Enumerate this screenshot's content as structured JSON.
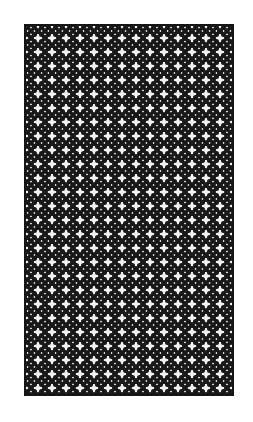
{
  "figure": {
    "title": "Woven Basket-Weave Lattice Pattern",
    "caption": "",
    "kind": "ornamental-pattern-plate",
    "canvas": {
      "width": 253,
      "height": 422,
      "background_color": "#ffffff"
    }
  },
  "frame": {
    "name": "rectangular-border",
    "x": 24,
    "y": 24,
    "width": 210,
    "height": 372,
    "border_color": "#151515",
    "border_width": 2,
    "fill_color": "#f2f2f0"
  },
  "pattern": {
    "name": "diagonal-basket-weave",
    "description": "Interlocking short diagonal dog-bone bars woven in two opposing 45 degree directions forming a dense lattice",
    "motif": "dog-bone-diagonal-bar",
    "tile_size": 14,
    "bar_thickness": 3.2,
    "cap_thickness": 5.0,
    "stroke_color": "#151515",
    "ground_color": "#f2f2f0",
    "direction_a_degrees": 45,
    "direction_b_degrees": -45,
    "repeats_horizontal": 15,
    "repeats_vertical": 27,
    "contrast": "high",
    "ink": "black",
    "paper": "off-white"
  },
  "texture": {
    "grain_color": "#d8d8d4",
    "grain_opacity": 0.35,
    "edge_softness": "slight"
  }
}
